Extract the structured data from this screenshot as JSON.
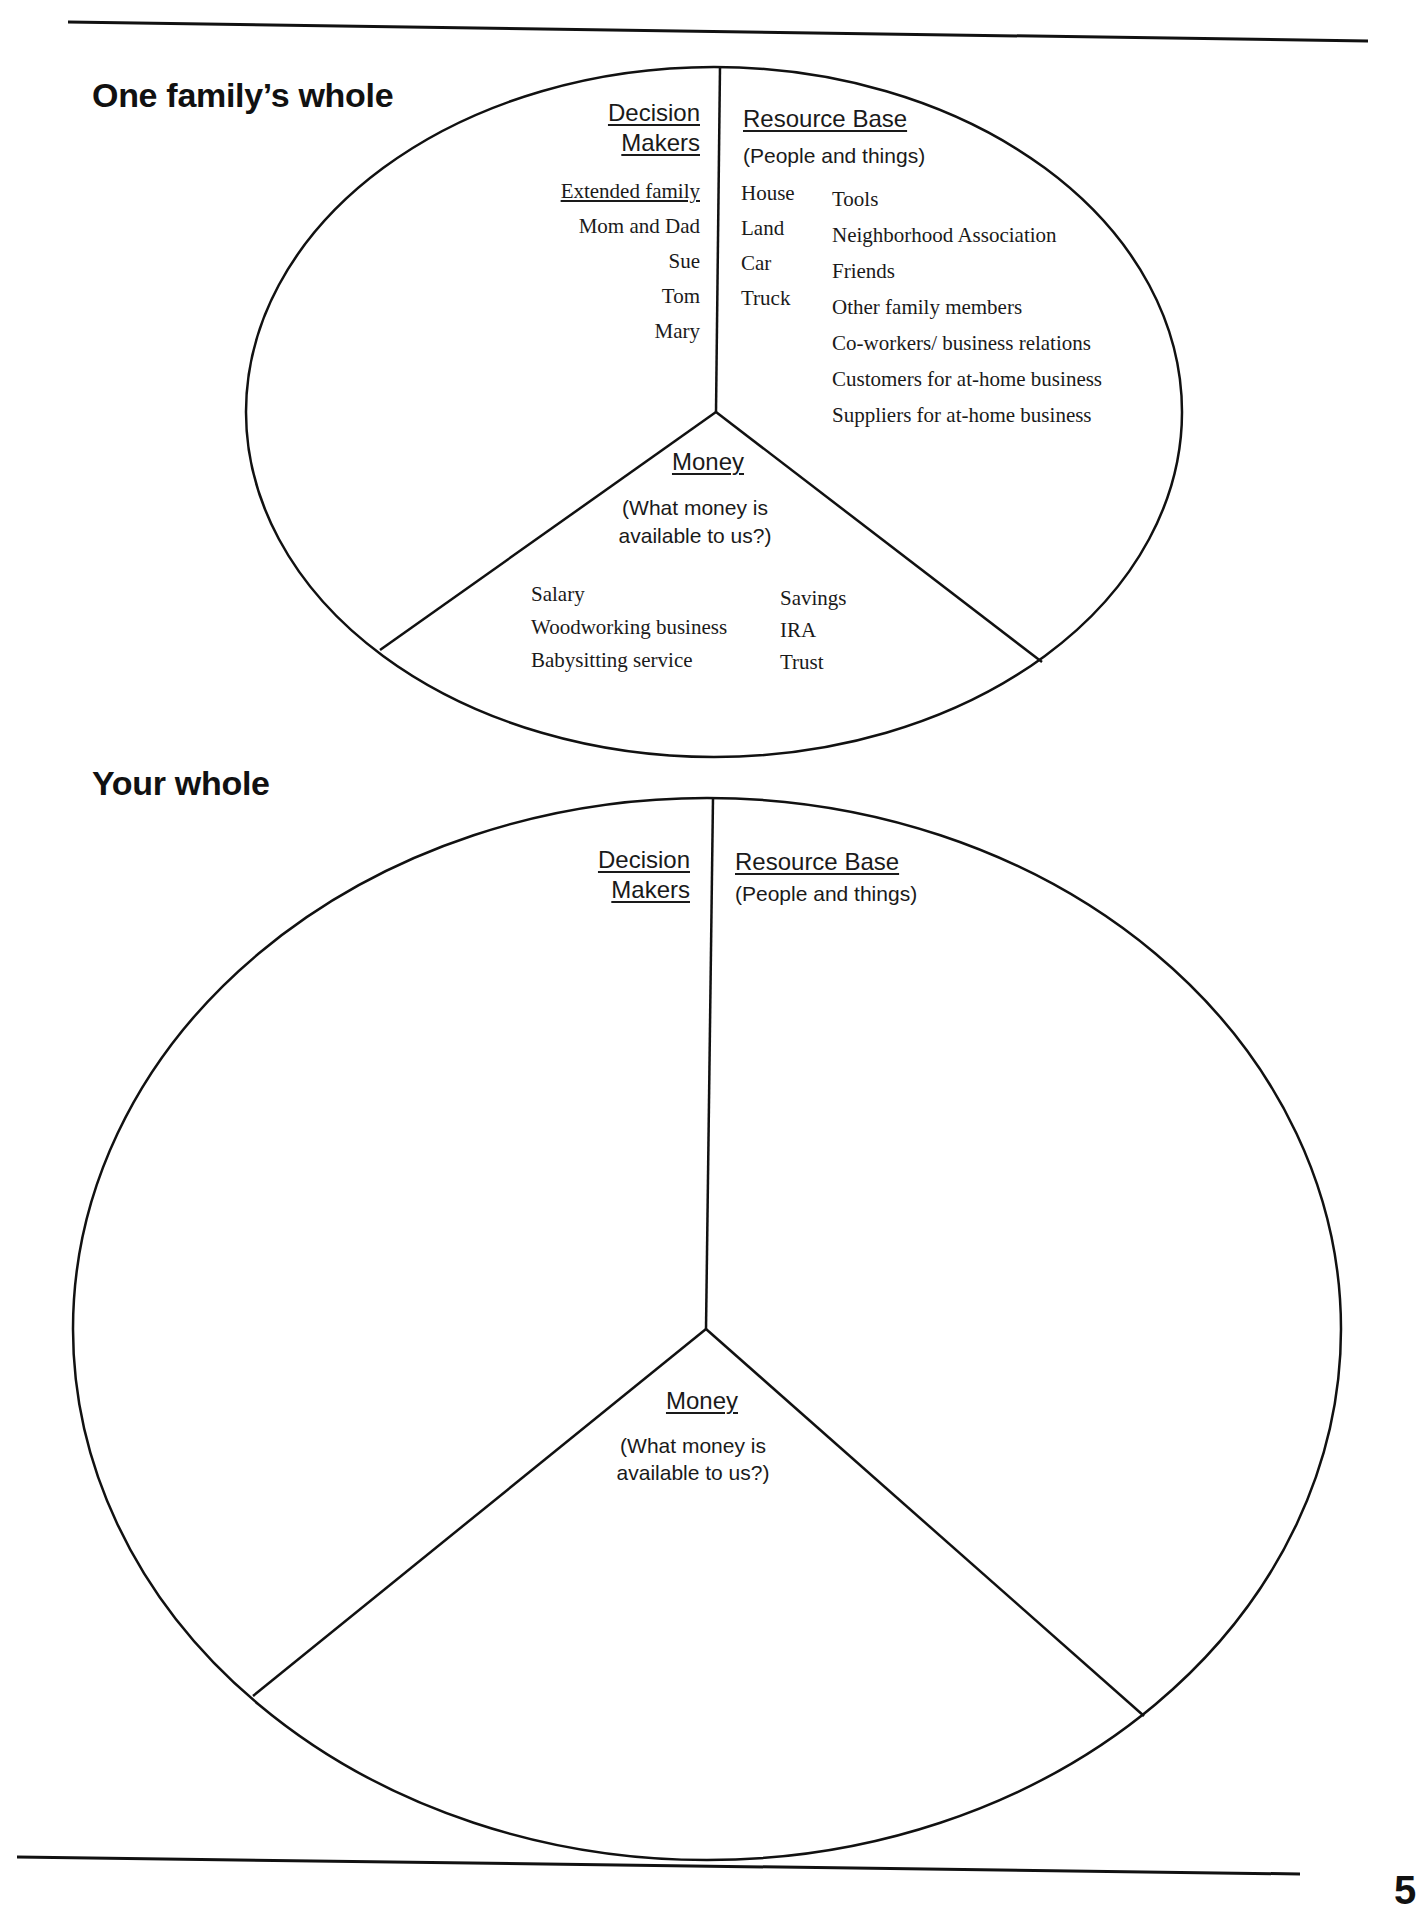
{
  "example": {
    "title": "One family’s whole",
    "decision_makers": {
      "heading_line1": "Decision",
      "heading_line2": "Makers",
      "group_label": "Extended family",
      "items": [
        "Mom and Dad",
        "Sue",
        "Tom",
        "Mary"
      ]
    },
    "resource_base": {
      "heading": "Resource Base",
      "subheading": "(People and things)",
      "things": [
        "House",
        "Land",
        "Car",
        "Truck"
      ],
      "people": [
        "Tools",
        "Neighborhood Association",
        "Friends",
        "Other family members",
        "Co-workers/ business relations",
        "Customers for at-home business",
        "Suppliers for at-home business"
      ]
    },
    "money": {
      "heading": "Money",
      "question_line1": "(What money is",
      "question_line2": "available to us?)",
      "income": [
        "Salary",
        "Woodworking business",
        "Babysitting service"
      ],
      "assets": [
        "Savings",
        "IRA",
        "Trust"
      ]
    }
  },
  "worksheet": {
    "title": "Your whole",
    "decision_makers": {
      "heading_line1": "Decision",
      "heading_line2": "Makers"
    },
    "resource_base": {
      "heading": "Resource Base",
      "subheading": "(People and things)"
    },
    "money": {
      "heading": "Money",
      "question_line1": "(What money is",
      "question_line2": "available to us?)"
    }
  },
  "page": {
    "number": "5"
  }
}
